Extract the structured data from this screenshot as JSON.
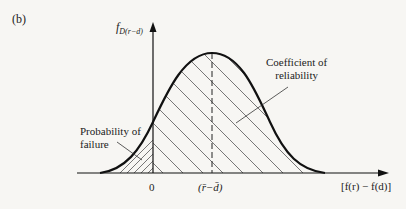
{
  "figure": {
    "panel_label": "(b)",
    "y_axis_label": "f",
    "y_axis_subscript": "D(r−d)",
    "x_axis_label": "[f(r) − f(d)]",
    "tick_zero": "0",
    "tick_mean": "(r̄−d̄)",
    "annotations": {
      "coefficient_line1": "Coefficient of",
      "coefficient_line2": "reliability",
      "probability_line1": "Probability of",
      "probability_line2": "failure"
    },
    "colors": {
      "curve": "#111111",
      "hatch": "#444444",
      "background": "#f7f6f3"
    }
  }
}
